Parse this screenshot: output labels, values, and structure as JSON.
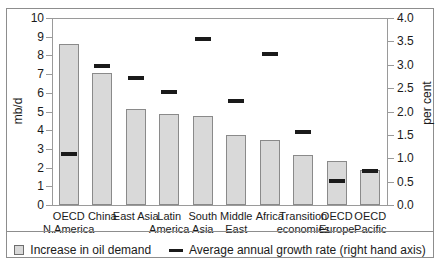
{
  "chart_data": {
    "type": "bar",
    "title": "",
    "xlabel": "",
    "ylabel": "mb/d",
    "y2label": "per cent",
    "ylim": [
      0,
      10
    ],
    "y2lim": [
      0.0,
      4.0
    ],
    "grid": false,
    "legend_position": "bottom-center",
    "categories": [
      "OECD\nN.America",
      "China",
      "East Asia",
      "Latin\nAmerica",
      "South\nAsia",
      "Middle\nEast",
      "Africa",
      "Transition\neconomies",
      "OECD\nEurope",
      "OECD\nPacific"
    ],
    "category_lines": [
      [
        "OECD",
        "N.America"
      ],
      [
        "China",
        ""
      ],
      [
        "East Asia",
        ""
      ],
      [
        "Latin",
        "America"
      ],
      [
        "South",
        "Asia"
      ],
      [
        "Middle",
        "East"
      ],
      [
        "Africa",
        ""
      ],
      [
        "Transition",
        "economies"
      ],
      [
        "OECD",
        "Europe"
      ],
      [
        "OECD",
        "Pacific"
      ]
    ],
    "series": [
      {
        "name": "Increase in oil demand",
        "axis": "left",
        "unit": "mb/d",
        "type": "bar",
        "color": "#d9d9d9",
        "values": [
          8.6,
          7.05,
          5.15,
          4.85,
          4.75,
          3.75,
          3.5,
          2.67,
          2.35,
          1.85
        ]
      },
      {
        "name": "Average annual growth rate (right hand axis)",
        "axis": "right",
        "unit": "per cent",
        "type": "marker",
        "color": "#1a1a1a",
        "values": [
          1.1,
          2.98,
          2.71,
          2.42,
          3.56,
          2.22,
          3.23,
          1.56,
          0.52,
          0.72
        ]
      }
    ],
    "yticks_left": [
      "0",
      "1",
      "2",
      "3",
      "4",
      "5",
      "6",
      "7",
      "8",
      "9",
      "10"
    ],
    "yticks_right": [
      "0.0",
      "0.5",
      "1.0",
      "1.5",
      "2.0",
      "2.5",
      "3.0",
      "3.5",
      "4.0"
    ],
    "legend": [
      {
        "label": "Increase in oil demand",
        "marker": "box-swatch"
      },
      {
        "label": "Average annual growth rate (right hand axis)",
        "marker": "line-swatch"
      }
    ]
  }
}
